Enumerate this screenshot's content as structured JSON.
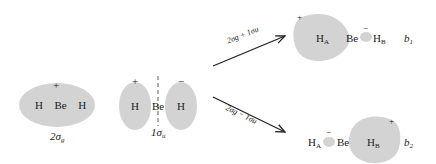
{
  "colors": {
    "lobe_fill": "#d3d3d3",
    "line": "#222222",
    "background": "#ffffff"
  },
  "orbital_2sg": {
    "sign": "+",
    "atoms": "H  Be  H",
    "label_main": "2σ",
    "label_sub": "g"
  },
  "orbital_1su": {
    "sign_left": "+",
    "sign_right": "−",
    "atom_left": "H",
    "atom_center": "Be",
    "atom_right": "H",
    "label_main": "1σ",
    "label_sub": "u"
  },
  "arrow_up": {
    "label": "2σg + 1σu"
  },
  "arrow_down": {
    "label": "2σg − 1σu"
  },
  "hybrid_b1": {
    "sign_large": "+",
    "sign_small": "−",
    "atom_a": "H",
    "atom_a_sub": "A",
    "atom_be": "Be",
    "atom_b": "H",
    "atom_b_sub": "B",
    "label_main": "b",
    "label_sub": "1"
  },
  "hybrid_b2": {
    "sign_large": "+",
    "sign_small": "−",
    "atom_a": "H",
    "atom_a_sub": "A",
    "atom_be": "Be",
    "atom_b": "H",
    "atom_b_sub": "B",
    "label_main": "b",
    "label_sub": "2"
  }
}
